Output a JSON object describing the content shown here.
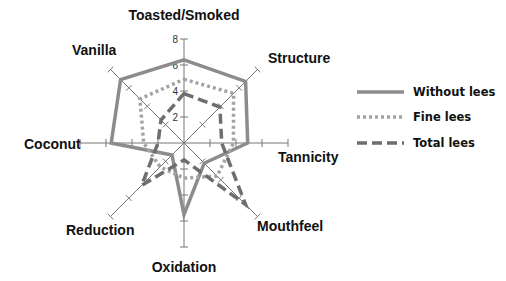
{
  "chart_data": {
    "type": "radar",
    "title": "",
    "axes": [
      "Toasted/Smoked",
      "Structure",
      "Tannicity",
      "Mouthfeel",
      "Oxidation",
      "Reduction",
      "Coconut",
      "Vanilla"
    ],
    "rlim": [
      0,
      8
    ],
    "ticks": [
      2,
      4,
      6,
      8
    ],
    "tick_labels": [
      "2",
      "4",
      "6",
      "8"
    ],
    "series": [
      {
        "name": "Without lees",
        "style": "solid",
        "color": "#8c8c8c",
        "values": [
          6.4,
          6.7,
          4.9,
          2.2,
          5.5,
          1.3,
          5.6,
          6.9
        ]
      },
      {
        "name": "Fine lees",
        "style": "dotted",
        "color": "#a3a3a3",
        "values": [
          4.9,
          5.4,
          3.8,
          3.6,
          2.7,
          2.6,
          3.1,
          4.8
        ]
      },
      {
        "name": "Total lees",
        "style": "dashed",
        "color": "#6e6e6e",
        "values": [
          3.8,
          3.9,
          2.9,
          6.7,
          1.3,
          4.6,
          2.0,
          2.5
        ]
      }
    ],
    "legend": {
      "placement": "right",
      "entries": [
        "Without lees",
        "Fine lees",
        "Total lees"
      ]
    }
  }
}
